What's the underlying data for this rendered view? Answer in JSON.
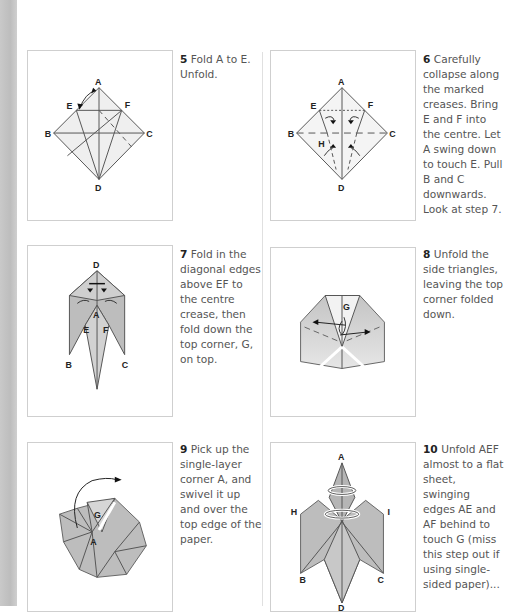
{
  "page": {
    "steps": [
      {
        "number": "5",
        "text": "Fold A to E. Unfold.",
        "labels": [
          "A",
          "B",
          "C",
          "D",
          "E",
          "F"
        ]
      },
      {
        "number": "6",
        "text": "Carefully collapse along the marked creases. Bring E and F into the centre. Let A swing down to touch E. Pull B and C downwards. Look at step 7.",
        "labels": [
          "A",
          "B",
          "C",
          "D",
          "E",
          "F",
          "H"
        ]
      },
      {
        "number": "7",
        "text": "Fold in the diagonal edges above EF to the centre crease, then fold down the top corner, G, on top.",
        "labels": [
          "D",
          "A",
          "E",
          "F",
          "B",
          "C"
        ]
      },
      {
        "number": "8",
        "text": "Unfold the side triangles, leaving the top corner folded down.",
        "labels": [
          "G"
        ]
      },
      {
        "number": "9",
        "text": "Pick up the single-layer corner A, and swivel it up and over the top edge of the paper.",
        "labels": [
          "G",
          "A"
        ]
      },
      {
        "number": "10",
        "text": "Unfold AEF almost to a flat sheet, swinging edges AE and AF behind to touch G (miss this step out if using single-sided paper)...",
        "labels": [
          "A",
          "H",
          "I",
          "B",
          "C",
          "D"
        ]
      }
    ]
  },
  "colors": {
    "paper_fill": "#bdbdbd",
    "paper_fill_light": "#e8e8e8",
    "line": "#555555",
    "strip": "#c4c4c4"
  }
}
